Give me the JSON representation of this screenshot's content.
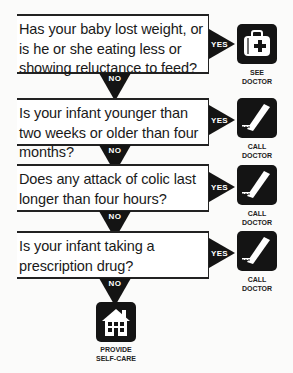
{
  "flowchart": {
    "questions": [
      {
        "text": "Has your baby lost weight, or is he or she eating less or showing reluctance to feed?",
        "yes_label": "YES",
        "no_label": "NO",
        "yes_action": {
          "icon": "doctor-bag-icon",
          "caption_line1": "SEE",
          "caption_line2": "DOCTOR"
        }
      },
      {
        "text": "Is your infant younger than two weeks or older than four months?",
        "yes_label": "YES",
        "no_label": "NO",
        "yes_action": {
          "icon": "telephone-icon",
          "caption_line1": "CALL",
          "caption_line2": "DOCTOR"
        }
      },
      {
        "text": "Does any attack of colic last longer than four hours?",
        "yes_label": "YES",
        "no_label": "NO",
        "yes_action": {
          "icon": "telephone-icon",
          "caption_line1": "CALL",
          "caption_line2": "DOCTOR"
        }
      },
      {
        "text": "Is your infant taking a prescription drug?",
        "yes_label": "YES",
        "no_label": "NO",
        "yes_action": {
          "icon": "telephone-icon",
          "caption_line1": "CALL",
          "caption_line2": "DOCTOR"
        }
      }
    ],
    "final_action": {
      "icon": "house-icon",
      "caption_line1": "PROVIDE",
      "caption_line2": "SELF-CARE"
    }
  }
}
